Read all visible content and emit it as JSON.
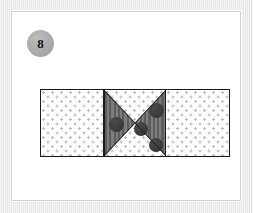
{
  "page": {
    "background_color": "#e7e7e7",
    "card_background_color": "#ffffff",
    "card_border_color": "#d2d2d2"
  },
  "badge": {
    "label": "8",
    "shape": "circle",
    "fill_color": "#ababab",
    "text_color": "#141414"
  },
  "figure": {
    "name": "three-panel-quilt-block-diagram",
    "panel_count": 3,
    "outline_color": "#1a1a1a",
    "panels": [
      {
        "position": "left",
        "pattern": "polka-dot",
        "fill_color": "#fdfdfd",
        "dot_color": "#b9b9b9"
      },
      {
        "position": "middle",
        "pattern": "hourglass-x-block",
        "triangles": [
          {
            "position": "left",
            "fill": "dark-stripe",
            "color": "#6d6d6d"
          },
          {
            "position": "right",
            "fill": "dark-stripe",
            "color": "#6d6d6d"
          },
          {
            "position": "top",
            "fill": "polka-dot",
            "color": "#fdfdfd"
          },
          {
            "position": "bottom",
            "fill": "polka-dot",
            "color": "#fdfdfd"
          }
        ],
        "motif_color": "#3b3b3b",
        "motif_count": 4,
        "motifs": [
          {
            "left": 4,
            "top": 27,
            "size": 15
          },
          {
            "left": 29,
            "top": 32,
            "size": 14
          },
          {
            "left": 44,
            "top": 13,
            "size": 15
          },
          {
            "left": 44,
            "top": 48,
            "size": 14
          }
        ]
      },
      {
        "position": "right",
        "pattern": "polka-dot",
        "fill_color": "#fdfdfd",
        "dot_color": "#b9b9b9"
      }
    ]
  }
}
